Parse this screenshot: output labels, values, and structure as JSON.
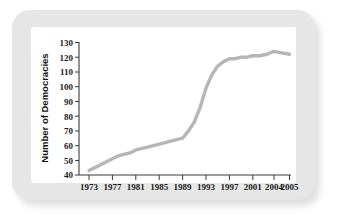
{
  "figure": {
    "background_color": "#ffffff",
    "frame_color": "#e6e6e6",
    "plot_background": "#ffffff",
    "line_color": "#b6b6b6",
    "axis_color": "#3a3a3a"
  },
  "chart_data": {
    "type": "line",
    "title": "",
    "subtitle": "",
    "xlabel": "",
    "ylabel": "Number of Democracies",
    "xlim": [
      1973,
      2005
    ],
    "ylim": [
      40,
      130
    ],
    "grid": false,
    "legend": false,
    "legend_position": "none",
    "x_tick_labels": [
      "1973",
      "1977",
      "1981",
      "1985",
      "1989",
      "1993",
      "1997",
      "2001",
      "2004",
      "2005"
    ],
    "y_tick_labels": [
      "40",
      "50",
      "60",
      "70",
      "80",
      "90",
      "100",
      "110",
      "120",
      "130"
    ],
    "series": [
      {
        "name": "Number of Democracies",
        "color": "#b6b6b6",
        "x": [
          1973,
          1974,
          1975,
          1976,
          1977,
          1978,
          1979,
          1980,
          1981,
          1982,
          1983,
          1984,
          1985,
          1986,
          1987,
          1988,
          1989,
          1990,
          1991,
          1992,
          1993,
          1994,
          1995,
          1996,
          1997,
          1998,
          1999,
          2000,
          2001,
          2002,
          2003,
          2004,
          2005
        ],
        "values": [
          43,
          45,
          47,
          49,
          51,
          53,
          54,
          55,
          57,
          58,
          59,
          60,
          61,
          62,
          63,
          64,
          65,
          70,
          76,
          86,
          99,
          108,
          114,
          117,
          119,
          119,
          120,
          120,
          121,
          121,
          122,
          124,
          122
        ]
      }
    ]
  }
}
